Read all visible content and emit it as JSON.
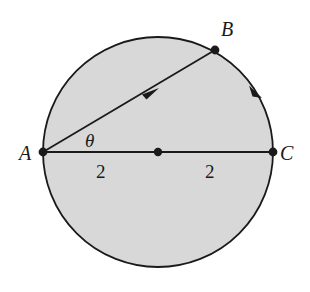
{
  "figure": {
    "kind": "circle-geometry-diagram",
    "background_color": "#ffffff",
    "disk_fill_color": "#d8d8d8",
    "stroke_color": "#1a1a1a"
  },
  "circle": {
    "center_x": 158,
    "center_y": 152,
    "radius": 115,
    "stroke_width": 1.8
  },
  "points": {
    "A": {
      "label": "A",
      "x": 43,
      "y": 152
    },
    "B": {
      "label": "B",
      "x": 215,
      "y": 50
    },
    "C": {
      "label": "C",
      "x": 273,
      "y": 152
    },
    "center": {
      "label": "",
      "x": 158,
      "y": 152
    }
  },
  "segments": {
    "diameter_AC": {
      "from": "A",
      "to": "C",
      "arrow": false
    },
    "chord_AB": {
      "from": "A",
      "to": "B",
      "arrow": true,
      "arrow_direction": "toward-B"
    }
  },
  "arcs": {
    "arc_BC": {
      "from": "B",
      "to": "C",
      "arrow": true,
      "arrow_direction": "clockwise-toward-C"
    }
  },
  "labels": {
    "angle": "θ",
    "left_radius": "2",
    "right_radius": "2"
  },
  "point_marker": {
    "radius": 4.2,
    "color": "#1a1a1a"
  }
}
